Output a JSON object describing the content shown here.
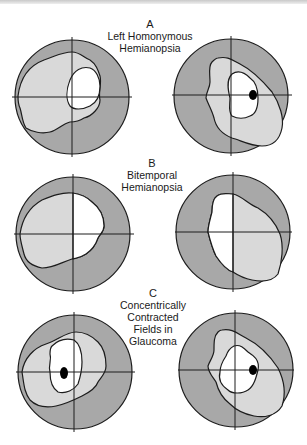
{
  "colors": {
    "outer_field": "#a8a8a8",
    "middle_field": "#d9d9d9",
    "inner_field": "#ffffff",
    "outline": "#1c1c1c",
    "blind_spot": "#000000"
  },
  "panels": [
    {
      "id": "A",
      "letter": "A",
      "title_lines": [
        "Left Homonymous",
        "Hemianopsia"
      ],
      "fields": [
        "left-eye",
        "right-eye"
      ]
    },
    {
      "id": "B",
      "letter": "B",
      "title_lines": [
        "Bitemporal",
        "Hemianopsia"
      ],
      "fields": [
        "left-eye",
        "right-eye"
      ]
    },
    {
      "id": "C",
      "letter": "C",
      "title_lines": [
        "Concentrically",
        "Contracted",
        "Fields in",
        "Glaucoma"
      ],
      "fields": [
        "left-eye",
        "right-eye"
      ]
    }
  ]
}
